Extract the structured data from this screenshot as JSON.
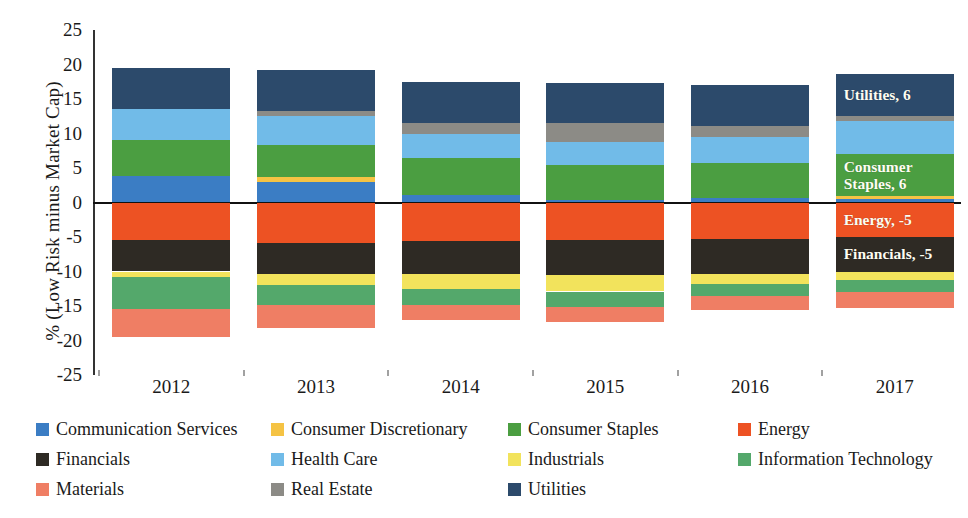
{
  "chart_data": {
    "type": "bar",
    "subtype": "stacked-bar-diverging",
    "title": "",
    "xlabel": "",
    "ylabel": "% (Low Risk minus Market Cap)",
    "ylim": [
      -25,
      25
    ],
    "yticks": [
      25,
      20,
      15,
      10,
      5,
      0,
      -5,
      -10,
      -15,
      -20,
      -25
    ],
    "ytick_labels": [
      "25",
      "20",
      "15",
      "10",
      "5",
      "0",
      "-5",
      "-10",
      "-15",
      "-20",
      "-25"
    ],
    "grid": false,
    "legend_position": "bottom",
    "categories": [
      "2012",
      "2013",
      "2014",
      "2015",
      "2016",
      "2017"
    ],
    "series": [
      {
        "name": "Communication Services",
        "color": "#3b7dc4",
        "values": [
          3.9,
          2.9,
          1.1,
          0.4,
          0.7,
          0.5
        ]
      },
      {
        "name": "Consumer Discretionary",
        "color": "#f5c344",
        "values": [
          0.0,
          0.8,
          0.0,
          0.0,
          0.0,
          0.5
        ]
      },
      {
        "name": "Consumer Staples",
        "color": "#4b9e41",
        "values": [
          5.2,
          4.6,
          5.4,
          5.0,
          5.0,
          6.0
        ]
      },
      {
        "name": "Energy",
        "color": "#ed5223",
        "values": [
          -5.5,
          -5.8,
          -5.6,
          -5.5,
          -5.3,
          -5.0
        ]
      },
      {
        "name": "Financials",
        "color": "#2e2a24",
        "values": [
          -4.5,
          -4.5,
          -4.8,
          -5.0,
          -5.0,
          -5.0
        ]
      },
      {
        "name": "Health Care",
        "color": "#71bbe8",
        "values": [
          4.5,
          4.2,
          3.4,
          3.3,
          3.8,
          4.8
        ]
      },
      {
        "name": "Industrials",
        "color": "#f2e35c",
        "values": [
          -0.8,
          -1.6,
          -2.2,
          -2.4,
          -1.5,
          -1.2
        ]
      },
      {
        "name": "Information Technology",
        "color": "#54a86b",
        "values": [
          -4.7,
          -3.0,
          -2.3,
          -2.2,
          -1.8,
          -1.8
        ]
      },
      {
        "name": "Materials",
        "color": "#ef7e64",
        "values": [
          -4.0,
          -3.3,
          -2.1,
          -2.2,
          -2.0,
          -2.3
        ]
      },
      {
        "name": "Real Estate",
        "color": "#8c8b86",
        "values": [
          0.0,
          0.7,
          1.6,
          2.8,
          1.6,
          0.8
        ]
      },
      {
        "name": "Utilities",
        "color": "#2c4a6b",
        "values": [
          5.9,
          6.0,
          6.0,
          5.8,
          6.0,
          6.0
        ]
      }
    ],
    "positive_stack_order": [
      "Communication Services",
      "Consumer Discretionary",
      "Consumer Staples",
      "Health Care",
      "Real Estate",
      "Utilities"
    ],
    "negative_stack_order": [
      "Consumer Discretionary",
      "Energy",
      "Financials",
      "Industrials",
      "Information Technology",
      "Materials"
    ],
    "data_labels": [
      {
        "category": "2017",
        "series": "Utilities",
        "text": "Utilities, 6"
      },
      {
        "category": "2017",
        "series": "Consumer Staples",
        "text": "Consumer\nStaples, 6"
      },
      {
        "category": "2017",
        "series": "Energy",
        "text": "Energy, -5"
      },
      {
        "category": "2017",
        "series": "Financials",
        "text": "Financials, -5"
      }
    ],
    "legend_entries": [
      "Communication Services",
      "Consumer Discretionary",
      "Consumer Staples",
      "Energy",
      "Financials",
      "Health Care",
      "Industrials",
      "Information Technology",
      "Materials",
      "Real Estate",
      "Utilities"
    ]
  }
}
